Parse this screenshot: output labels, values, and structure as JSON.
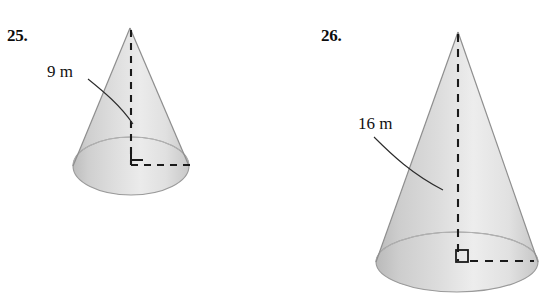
{
  "page": {
    "background_color": "#ffffff",
    "width": 545,
    "height": 302
  },
  "exercises": [
    {
      "number": "25.",
      "figure": "cone",
      "slant_height": "9 m",
      "radius": "4 m",
      "right_angle_marker": "right-angle-marker",
      "height_line": "dashed-height-line",
      "radius_line": "dashed-radius-line"
    },
    {
      "number": "26.",
      "figure": "cone",
      "slant_height": "16 m",
      "radius": "5 m",
      "right_angle_marker": "right-angle-marker",
      "height_line": "dashed-height-line",
      "radius_line": "dashed-radius-line"
    }
  ],
  "colors": {
    "ink": "#111111",
    "number_ink": "#0d0d0d",
    "cone_outline": "#8d8d8d",
    "cone_shade_dark": "#b4b4b4",
    "cone_shade_mid": "#d2d2d2",
    "cone_shade_light": "#ececec",
    "cone_shade_edge": "#c3c3c3",
    "dash_color": "#1a1a1a"
  }
}
